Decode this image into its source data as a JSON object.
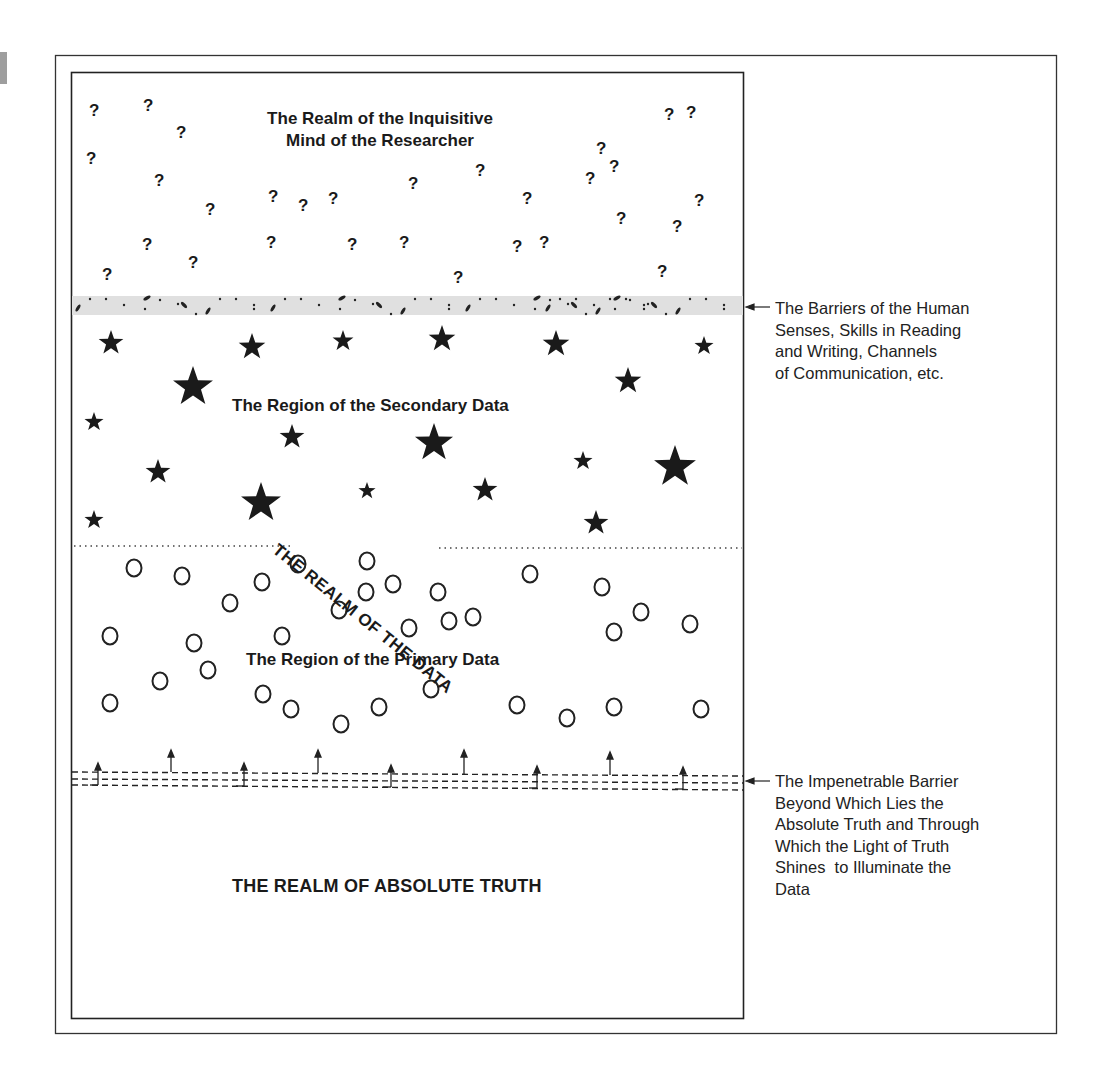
{
  "diagram": {
    "regions": {
      "inquisitive_mind": {
        "label_line1": "The Realm of the Inquisitive",
        "label_line2": "Mind of the Researcher",
        "symbol": "question-mark"
      },
      "secondary_data": {
        "label": "The Region of the Secondary Data",
        "symbol": "star"
      },
      "primary_data": {
        "label": "The Region of the Primary Data",
        "symbol": "circle"
      },
      "realm_of_data": {
        "label": "THE REALM OF THE DATA"
      },
      "absolute_truth": {
        "label": "THE REALM OF ABSOLUTE TRUTH"
      }
    },
    "barriers": {
      "human_senses": {
        "lines": [
          "The Barriers of the Human",
          "Senses, Skills in Reading",
          "and Writing, Channels",
          "of Communication, etc."
        ],
        "fill": "#e0e0e0"
      },
      "impenetrable": {
        "lines": [
          "The Impenetrable Barrier",
          "Beyond Which Lies the",
          "Absolute Truth and Through",
          "Which the Light of Truth",
          "Shines  to Illuminate the",
          "Data"
        ]
      }
    },
    "question_mark": "?",
    "colors": {
      "ink": "#1a1a1a",
      "band": "#e0e0e0",
      "tab": "#9e9e9e"
    }
  }
}
